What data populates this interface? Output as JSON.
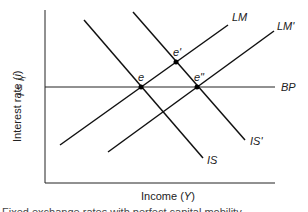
{
  "diagram": {
    "type": "IS-LM-BP diagram",
    "y_axis_label": "Interest rate (i)",
    "x_axis_label": "Income (Y)",
    "bp_level_label": "i = i_f",
    "curves": [
      {
        "name": "IS",
        "label": "IS"
      },
      {
        "name": "IS'",
        "label": "IS'"
      },
      {
        "name": "LM",
        "label": "LM"
      },
      {
        "name": "LM'",
        "label": "LM'"
      },
      {
        "name": "BP",
        "label": "BP"
      }
    ],
    "points": [
      {
        "label": "e",
        "intersection": "IS, LM, BP"
      },
      {
        "label": "e'",
        "intersection": "IS', LM"
      },
      {
        "label": "e''",
        "intersection": "IS', LM', BP"
      }
    ],
    "caption": "Fixed exchange rates with perfect capital mobility"
  },
  "labels": {
    "ylabel_main": "Interest rate (",
    "ylabel_var": "i",
    "ylabel_close": ")",
    "xlabel_main": "Income (",
    "xlabel_var": "Y",
    "xlabel_close": ")",
    "bp_i": "i",
    "bp_eq": " = ",
    "bp_if": "i",
    "bp_sub": "f",
    "is": "IS",
    "is_prime": "IS'",
    "lm": "LM",
    "lm_prime": "LM'",
    "bp": "BP",
    "e": "e",
    "e_prime": "e'",
    "e_dprime": "e\""
  }
}
